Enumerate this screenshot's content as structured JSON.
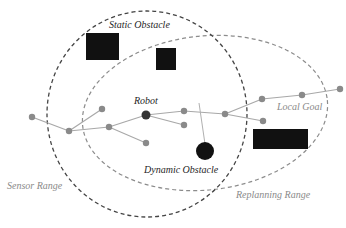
{
  "labels": {
    "static_obstacle": "Static Obstacle",
    "robot": "Robot",
    "local_goal": "Local Goal",
    "dynamic_obstacle": "Dynamic Obstacle",
    "sensor_range": "Sensor Range",
    "replanning_range": "Replanning Range"
  },
  "colors": {
    "obstacle": "#111111",
    "tree_edge": "#a8a8a8",
    "tree_node": "#8a8a8a",
    "robot_node": "#333333",
    "sensor_range": "#444444",
    "replanning_range": "#8c8c8c"
  },
  "tree": {
    "nodes": [
      {
        "id": "n0",
        "role": "leaf"
      },
      {
        "id": "n1",
        "role": "branch"
      },
      {
        "id": "n2",
        "role": "leaf"
      },
      {
        "id": "n3",
        "role": "branch"
      },
      {
        "id": "robot",
        "role": "robot"
      },
      {
        "id": "n5",
        "role": "leaf"
      },
      {
        "id": "n6",
        "role": "branch"
      },
      {
        "id": "n7",
        "role": "leaf"
      },
      {
        "id": "n8",
        "role": "branch"
      },
      {
        "id": "n9",
        "role": "branch"
      },
      {
        "id": "n10",
        "role": "leaf"
      },
      {
        "id": "n11",
        "role": "branch"
      },
      {
        "id": "goal",
        "role": "local-goal"
      }
    ],
    "edges": [
      [
        "n0",
        "n1"
      ],
      [
        "n1",
        "n2"
      ],
      [
        "n1",
        "n3"
      ],
      [
        "n3",
        "robot"
      ],
      [
        "n3",
        "n5"
      ],
      [
        "robot",
        "n6"
      ],
      [
        "robot",
        "n7"
      ],
      [
        "n6",
        "n8"
      ],
      [
        "n8",
        "n9"
      ],
      [
        "n8",
        "n10"
      ],
      [
        "n9",
        "n11"
      ],
      [
        "n11",
        "goal"
      ]
    ]
  }
}
